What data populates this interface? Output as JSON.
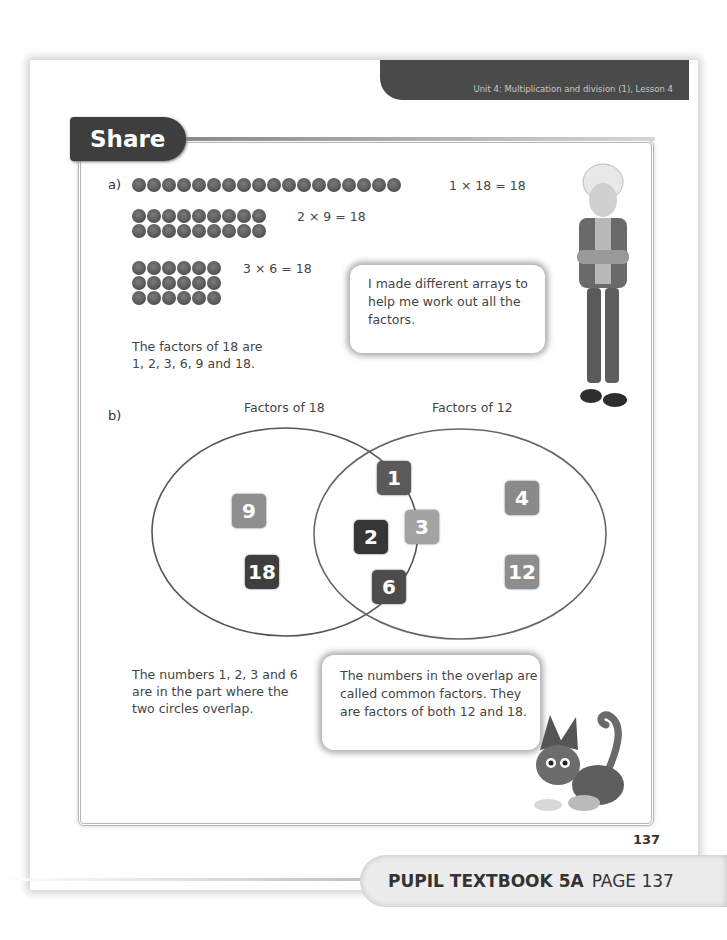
{
  "header": {
    "unit_label": "Unit 4: Multiplication and division (1), Lesson 4"
  },
  "section": {
    "title": "Share"
  },
  "part_a": {
    "label": "a)",
    "arrays": [
      {
        "rows": 1,
        "cols": 18,
        "equation": "1 × 18 = 18"
      },
      {
        "rows": 2,
        "cols": 9,
        "equation": "2 × 9 = 18"
      },
      {
        "rows": 3,
        "cols": 6,
        "equation": "3 × 6 = 18"
      }
    ],
    "factors_text_line1": "The factors of 18 are",
    "factors_text_line2": "1, 2, 3, 6, 9 and 18.",
    "boy_speech": "I made different arrays to help me work out all the factors."
  },
  "part_b": {
    "label": "b)",
    "venn": {
      "left_label": "Factors of 18",
      "right_label": "Factors of 12",
      "left_only": [
        {
          "value": "9",
          "color": "#8f8f8f"
        },
        {
          "value": "18",
          "color": "#3e3e3e"
        }
      ],
      "overlap": [
        {
          "value": "1",
          "color": "#5a5a5a"
        },
        {
          "value": "2",
          "color": "#363636"
        },
        {
          "value": "3",
          "color": "#a3a3a3"
        },
        {
          "value": "6",
          "color": "#4c4c4c"
        }
      ],
      "right_only": [
        {
          "value": "4",
          "color": "#8a8a8a"
        },
        {
          "value": "12",
          "color": "#8d8d8d"
        }
      ]
    },
    "overlap_text": "The numbers 1, 2, 3 and 6 are in the part where the two circles overlap.",
    "cat_speech": "The numbers in the overlap are called common factors. They are factors of both 12 and 18."
  },
  "page_number": "137",
  "footer": {
    "book_label": "PUPIL TEXTBOOK 5A",
    "page_label": "PAGE 137"
  }
}
